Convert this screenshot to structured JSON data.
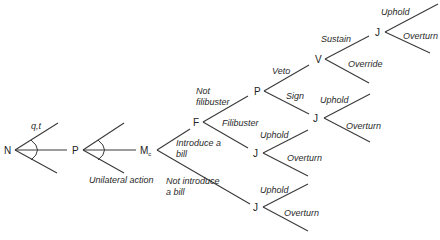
{
  "diagram": {
    "type": "game-tree",
    "nodes": {
      "N": {
        "label": "N",
        "x": 5,
        "y": 153
      },
      "P1": {
        "label": "P",
        "x": 70,
        "y": 153
      },
      "Mc": {
        "label": "M",
        "sub": "c",
        "x": 140,
        "y": 153
      },
      "F": {
        "label": "F",
        "x": 193,
        "y": 126
      },
      "P2": {
        "label": "P",
        "x": 254,
        "y": 95
      },
      "V": {
        "label": "V",
        "x": 315,
        "y": 63
      },
      "J_top": {
        "label": "J",
        "x": 375,
        "y": 36
      },
      "J_sign": {
        "label": "J",
        "x": 313,
        "y": 122
      },
      "J_filibuster": {
        "label": "J",
        "x": 253,
        "y": 157
      },
      "J_bottom": {
        "label": "J",
        "x": 253,
        "y": 211
      }
    },
    "branch_labels": {
      "nature_move": "q,t",
      "unilateral": "Unilateral action",
      "introduce_line1": "Introduce a",
      "introduce_line2": "bill",
      "not_introduce_line1": "Not introduce",
      "not_introduce_line2": "a bill",
      "not_filibuster_line1": "Not",
      "not_filibuster_line2": "filibuster",
      "filibuster": "Filibuster",
      "veto": "Veto",
      "sign": "Sign",
      "sustain": "Sustain",
      "override": "Override",
      "uphold_top": "Uphold",
      "overturn_top": "Overturn",
      "uphold_sign": "Uphold",
      "overturn_sign": "Overturn",
      "uphold_filibuster": "Uphold",
      "overturn_filibuster": "Overturn",
      "uphold_bottom": "Uphold",
      "overturn_bottom": "Overturn"
    }
  }
}
